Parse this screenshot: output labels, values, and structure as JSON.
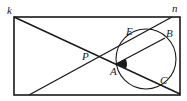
{
  "diagram": {
    "type": "geometry",
    "colors": {
      "ink": "#1a1a1a",
      "background": "#ffffff"
    },
    "rectangle": {
      "x": 14,
      "y": 17,
      "width": 166,
      "height": 78
    },
    "points": {
      "k": {
        "label": "k",
        "x": 14,
        "y": 17,
        "label_x": 7,
        "label_y": 14
      },
      "n": {
        "label": "n",
        "x": 172,
        "y": 17,
        "label_x": 172,
        "label_y": 12
      },
      "P": {
        "label": "P",
        "x": 97,
        "y": 56,
        "label_x": 82,
        "label_y": 60
      },
      "A": {
        "label": "A",
        "x": 116,
        "y": 64,
        "label_x": 110,
        "label_y": 75
      },
      "E": {
        "label": "E",
        "x": 136,
        "y": 33,
        "label_x": 126,
        "label_y": 35
      },
      "B": {
        "label": "B",
        "x": 165,
        "y": 38,
        "label_x": 166,
        "label_y": 37
      },
      "C": {
        "label": "C",
        "x": 164,
        "y": 86,
        "label_x": 160,
        "label_y": 84
      }
    },
    "segments": [
      {
        "name": "diagonal-k-to-bottom-right",
        "x1": 14,
        "y1": 17,
        "x2": 180,
        "y2": 94
      },
      {
        "name": "line-bottom-left-to-n",
        "x1": 29,
        "y1": 95,
        "x2": 172,
        "y2": 17
      },
      {
        "name": "segment-AB",
        "x1": 116,
        "y1": 64,
        "x2": 165,
        "y2": 38
      }
    ],
    "circle": {
      "cx": 146,
      "cy": 59,
      "r": 30
    },
    "angle_marker": {
      "vertex": "A",
      "between": [
        "B",
        "C"
      ],
      "filled": true
    }
  }
}
